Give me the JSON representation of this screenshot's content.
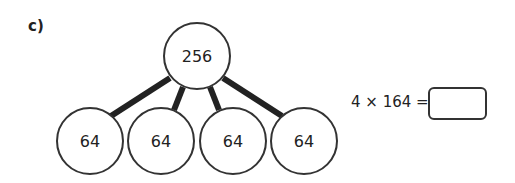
{
  "question": {
    "label": "c)",
    "partition": {
      "whole": "256",
      "parts": [
        "64",
        "64",
        "64",
        "64"
      ]
    },
    "equation": {
      "text": "4 × 164 =",
      "answer": ""
    }
  },
  "colors": {
    "line": "#222222",
    "circle_stroke": "#333333",
    "text": "#222222"
  }
}
